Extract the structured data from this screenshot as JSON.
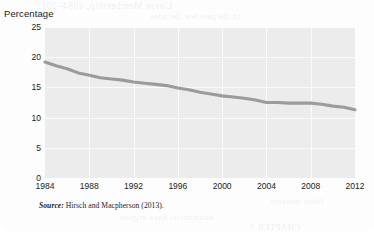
{
  "figure": {
    "y_axis_title": "Percentage",
    "source_label": "Source:",
    "source_text": "Hirsch and Macpherson (2013)."
  },
  "bleed_through": {
    "l1": "Union Membership, 1984–2012",
    "l2": "in the past few decades",
    "l3": "the share of workers who",
    "l4": "belong to a union has",
    "l5": "declined steadily since",
    "l6": "wages and benefits for",
    "l7": "collective bargaining",
    "l8": "manufacturing sector",
    "l9": "economists have argued",
    "l10": "CHAPTER 9",
    "l11": "labor markets"
  },
  "chart_data": {
    "type": "line",
    "title": "",
    "xlabel": "",
    "ylabel": "Percentage",
    "xlim": [
      1984,
      2012
    ],
    "ylim": [
      0,
      25
    ],
    "grid": true,
    "legend": "none",
    "xticks": [
      1984,
      1988,
      1992,
      1996,
      2000,
      2004,
      2008,
      2012
    ],
    "yticks": [
      0,
      5,
      10,
      15,
      20,
      25
    ],
    "line_color": "#9b9b9b",
    "plot_background": "#ececec",
    "gridline_color": "#fbfbfb",
    "series": [
      {
        "name": "Union membership rate",
        "x": [
          1984,
          1985,
          1986,
          1987,
          1988,
          1989,
          1990,
          1991,
          1992,
          1993,
          1994,
          1995,
          1996,
          1997,
          1998,
          1999,
          2000,
          2001,
          2002,
          2003,
          2004,
          2005,
          2006,
          2007,
          2008,
          2009,
          2010,
          2011,
          2012
        ],
        "values": [
          19.2,
          18.6,
          18.1,
          17.4,
          17.0,
          16.6,
          16.4,
          16.2,
          15.9,
          15.7,
          15.5,
          15.3,
          14.9,
          14.6,
          14.2,
          13.9,
          13.6,
          13.4,
          13.2,
          12.9,
          12.5,
          12.5,
          12.4,
          12.4,
          12.4,
          12.2,
          11.9,
          11.7,
          11.3
        ]
      }
    ]
  }
}
